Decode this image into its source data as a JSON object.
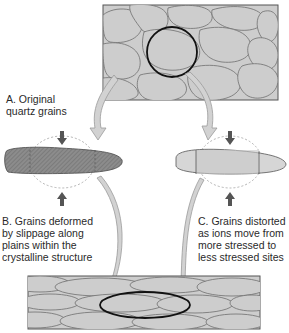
{
  "labels": {
    "a": "A. Original\nquartz grains",
    "b": "B. Grains deformed\nby slippage along\nplains within the\ncrystalline structure",
    "c": "C. Grains distorted\nas ions move from\nmore stressed to\nless stressed sites"
  },
  "colors": {
    "grain_fill": "#cdcdcd",
    "grain_border": "#6e6e6e",
    "box_border": "#555555",
    "highlight_ring": "#111111",
    "arrow_fill": "#d2d2d2",
    "arrow_stroke": "#9a9a9a",
    "deformed_fill": "#8a8a8a",
    "distorted_fill": "#d6d6d6",
    "stress_arrow": "#555555",
    "dashed_outline": "#aaaaaa"
  }
}
